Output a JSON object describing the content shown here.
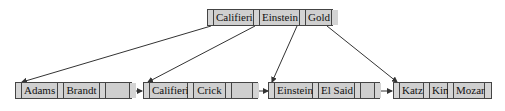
{
  "diagram": {
    "type": "B+ tree",
    "root": {
      "keys": [
        "Califieri",
        "Einstein",
        "Gold"
      ]
    },
    "leaves": [
      {
        "keys": [
          "Adams",
          "Brandt",
          ""
        ]
      },
      {
        "keys": [
          "Califieri",
          "Crick",
          ""
        ]
      },
      {
        "keys": [
          "Einstein",
          "El Said",
          ""
        ]
      },
      {
        "keys": [
          "Katz",
          "Kim",
          "Mozart"
        ]
      }
    ],
    "colors": {
      "cell_fill": "#cfcfcf",
      "border": "#444444",
      "arrow": "#333333"
    }
  }
}
